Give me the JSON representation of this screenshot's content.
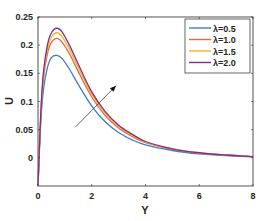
{
  "chart_data": {
    "type": "line",
    "title": "",
    "xlabel": "Y",
    "ylabel": "U",
    "xlim": [
      0,
      8
    ],
    "ylim": [
      -0.05,
      0.25
    ],
    "xticks": [
      "0",
      "2",
      "4",
      "6",
      "8"
    ],
    "yticks": [
      "0",
      "0.05",
      "0.1",
      "0.15",
      "0.2",
      "0.25"
    ],
    "grid": false,
    "legend_position": "upper right",
    "x": [
      0,
      0.1,
      0.2,
      0.35,
      0.5,
      0.7,
      0.9,
      1.2,
      1.5,
      2.0,
      2.5,
      3.0,
      3.5,
      4.0,
      5.0,
      6.0,
      7.0,
      8.0
    ],
    "series": [
      {
        "name": "λ=0.5",
        "color": "#3d7cc9",
        "values": [
          -0.05,
          0.06,
          0.12,
          0.16,
          0.178,
          0.182,
          0.176,
          0.155,
          0.13,
          0.092,
          0.064,
          0.045,
          0.032,
          0.023,
          0.013,
          0.007,
          0.004,
          0.002
        ]
      },
      {
        "name": "λ=1.0",
        "color": "#e8643a",
        "values": [
          -0.05,
          0.07,
          0.14,
          0.185,
          0.205,
          0.212,
          0.205,
          0.182,
          0.153,
          0.108,
          0.075,
          0.053,
          0.038,
          0.027,
          0.015,
          0.008,
          0.005,
          0.002
        ]
      },
      {
        "name": "λ=1.5",
        "color": "#f0b429",
        "values": [
          -0.05,
          0.073,
          0.146,
          0.193,
          0.214,
          0.222,
          0.215,
          0.19,
          0.16,
          0.113,
          0.079,
          0.056,
          0.04,
          0.028,
          0.016,
          0.009,
          0.005,
          0.002
        ]
      },
      {
        "name": "λ=2.0",
        "color": "#7e2f8e",
        "values": [
          -0.05,
          0.076,
          0.151,
          0.2,
          0.222,
          0.23,
          0.223,
          0.197,
          0.166,
          0.117,
          0.082,
          0.058,
          0.042,
          0.029,
          0.016,
          0.009,
          0.005,
          0.002
        ]
      }
    ],
    "annotations": [
      {
        "type": "arrow",
        "from": [
          1.4,
          0.055
        ],
        "to": [
          2.9,
          0.128
        ],
        "meaning": "increasing λ"
      }
    ]
  }
}
